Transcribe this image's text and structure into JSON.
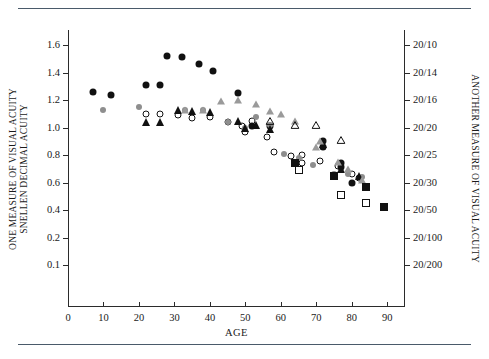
{
  "chart_data": {
    "type": "scatter",
    "title": "",
    "xlabel": "AGE",
    "ylabel": "ONE MEASURE OF VISUAL ACUITY SNELLEN DECIMAL ACUITY",
    "ylabel_right": "ANOTHER MEASURE OF VISUAL ACUITY",
    "grid": false,
    "legend": "none",
    "xlim": [
      0,
      95
    ],
    "x_ticks": [
      0,
      10,
      20,
      30,
      40,
      50,
      60,
      70,
      80,
      90
    ],
    "y_ticks_left": [
      "1.6",
      "1.4",
      "1.2",
      "1.0",
      "0.8",
      "0.6",
      "0.4",
      "0.2",
      "0.1"
    ],
    "y_ticks_left_values": [
      1.6,
      1.4,
      1.2,
      1.0,
      0.8,
      0.6,
      0.4,
      0.2,
      0.1
    ],
    "y_ticks_right": [
      "20/10",
      "20/14",
      "20/16",
      "20/20",
      "20/25",
      "20/30",
      "20/50",
      "20/100",
      "20/200"
    ],
    "y_axis_note": "Left axis is linear from 0.2 to 1.6; the 0.1 tick is placed below 0.2 at equal tick spacing (non-linear bottom segment).",
    "series": [
      {
        "name": "filled-circle",
        "marker": "circle-filled",
        "color": "#111111",
        "points": [
          [
            7,
            1.26
          ],
          [
            12,
            1.24
          ],
          [
            22,
            1.31
          ],
          [
            26,
            1.31
          ],
          [
            28,
            1.52
          ],
          [
            32,
            1.51
          ],
          [
            37,
            1.46
          ],
          [
            41,
            1.41
          ],
          [
            48,
            1.25
          ],
          [
            52,
            1.01
          ],
          [
            57,
            1.01
          ],
          [
            72,
            0.9
          ],
          [
            72,
            0.86
          ],
          [
            77,
            0.74
          ],
          [
            77,
            0.71
          ],
          [
            80,
            0.6
          ]
        ]
      },
      {
        "name": "open-circle",
        "marker": "circle-open",
        "color": "#111111",
        "points": [
          [
            22,
            1.1
          ],
          [
            26,
            1.1
          ],
          [
            31,
            1.09
          ],
          [
            35,
            1.07
          ],
          [
            40,
            1.08
          ],
          [
            45,
            1.04
          ],
          [
            49,
            1.01
          ],
          [
            50,
            0.97
          ],
          [
            52,
            1.05
          ],
          [
            56,
            0.93
          ],
          [
            58,
            0.82
          ],
          [
            63,
            0.79
          ],
          [
            66,
            0.74
          ],
          [
            66,
            0.8
          ],
          [
            71,
            0.76
          ],
          [
            76,
            0.72
          ],
          [
            80,
            0.66
          ],
          [
            82,
            0.63
          ]
        ]
      },
      {
        "name": "gray-circle",
        "marker": "circle-gray",
        "color": "#8e8e8e",
        "points": [
          [
            10,
            1.13
          ],
          [
            20,
            1.15
          ],
          [
            33,
            1.13
          ],
          [
            38,
            1.13
          ],
          [
            45,
            1.04
          ],
          [
            50,
            1.0
          ],
          [
            53,
            1.08
          ],
          [
            57,
            1.02
          ],
          [
            61,
            0.81
          ],
          [
            65,
            0.78
          ],
          [
            69,
            0.73
          ],
          [
            75,
            0.66
          ],
          [
            79,
            0.66
          ],
          [
            83,
            0.64
          ]
        ]
      },
      {
        "name": "filled-triangle",
        "marker": "triangle-filled",
        "color": "#111111",
        "points": [
          [
            22,
            1.04
          ],
          [
            26,
            1.04
          ],
          [
            31,
            1.13
          ],
          [
            35,
            1.12
          ],
          [
            40,
            1.11
          ],
          [
            48,
            1.05
          ],
          [
            50,
            1.0
          ],
          [
            53,
            1.02
          ],
          [
            57,
            0.99
          ],
          [
            72,
            0.88
          ],
          [
            77,
            0.7
          ],
          [
            82,
            0.65
          ]
        ]
      },
      {
        "name": "gray-triangle",
        "marker": "triangle-gray",
        "color": "#9a9a9a",
        "points": [
          [
            33,
            1.13
          ],
          [
            38,
            1.13
          ],
          [
            43,
            1.19
          ],
          [
            48,
            1.2
          ],
          [
            53,
            1.17
          ],
          [
            57,
            1.12
          ],
          [
            60,
            1.1
          ],
          [
            64,
            1.05
          ],
          [
            70,
            0.86
          ],
          [
            71,
            0.9
          ],
          [
            76,
            0.75
          ],
          [
            79,
            0.7
          ],
          [
            83,
            0.62
          ]
        ]
      },
      {
        "name": "open-triangle",
        "marker": "triangle-open",
        "color": "#111111",
        "points": [
          [
            57,
            1.05
          ],
          [
            64,
            1.02
          ],
          [
            70,
            1.02
          ],
          [
            77,
            0.91
          ]
        ]
      },
      {
        "name": "filled-square",
        "marker": "square-filled",
        "color": "#111111",
        "points": [
          [
            64,
            0.74
          ],
          [
            75,
            0.65
          ],
          [
            84,
            0.57
          ],
          [
            89,
            0.42
          ]
        ]
      },
      {
        "name": "open-square",
        "marker": "square-open",
        "color": "#111111",
        "points": [
          [
            65,
            0.69
          ],
          [
            77,
            0.51
          ],
          [
            84,
            0.45
          ]
        ]
      }
    ]
  }
}
